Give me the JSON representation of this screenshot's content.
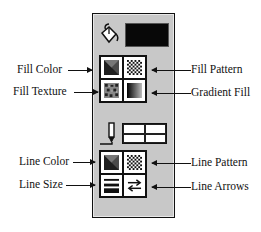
{
  "panel": {
    "fill_section": {
      "current_fill_color": "#080808",
      "buttons": [
        {
          "id": "fill-color",
          "icon": "fill-color-icon",
          "label": "Fill Color"
        },
        {
          "id": "fill-pattern",
          "icon": "fill-pattern-icon",
          "label": "Fill Pattern"
        },
        {
          "id": "fill-texture",
          "icon": "fill-texture-icon",
          "label": "Fill Texture"
        },
        {
          "id": "gradient-fill",
          "icon": "gradient-fill-icon",
          "label": "Gradient Fill"
        }
      ]
    },
    "line_section": {
      "buttons": [
        {
          "id": "line-color",
          "icon": "line-color-icon",
          "label": "Line Color"
        },
        {
          "id": "line-pattern",
          "icon": "line-pattern-icon",
          "label": "Line Pattern"
        },
        {
          "id": "line-size",
          "icon": "line-size-icon",
          "label": "Line Size"
        },
        {
          "id": "line-arrows",
          "icon": "line-arrows-icon",
          "label": "Line Arrows"
        }
      ]
    }
  },
  "callouts": {
    "fill_color": "Fill Color",
    "fill_pattern": "Fill Pattern",
    "fill_texture": "Fill Texture",
    "gradient_fill": "Gradient Fill",
    "line_color": "Line Color",
    "line_pattern": "Line Pattern",
    "line_size": "Line Size",
    "line_arrows": "Line Arrows"
  },
  "colors": {
    "panel_bg": "#c8c8c8",
    "border": "#111111",
    "swatch": "#080808"
  }
}
